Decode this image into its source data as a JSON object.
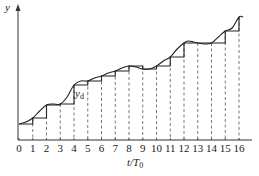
{
  "chart_data": {
    "type": "line",
    "title": "",
    "xlabel": "t/T0",
    "ylabel": "y",
    "annotations": [
      {
        "text": "y_d",
        "near_x": 4.3,
        "description": "label of the sampled/held staircase signal"
      }
    ],
    "grid": false,
    "legend": null,
    "x_ticks": [
      0,
      1,
      2,
      3,
      4,
      5,
      6,
      7,
      8,
      9,
      10,
      11,
      12,
      13,
      14,
      15,
      16
    ],
    "xlim": [
      0,
      16.7
    ],
    "ylim": [
      0,
      13
    ],
    "series": [
      {
        "name": "y (continuous signal)",
        "style": "smooth-curve",
        "x": [
          0,
          0.5,
          1,
          1.5,
          2,
          2.5,
          3,
          3.5,
          4,
          4.5,
          5,
          5.5,
          6,
          6.5,
          7,
          7.5,
          8,
          8.5,
          9,
          9.5,
          10,
          10.5,
          11,
          11.5,
          12,
          12.3,
          12.7,
          13,
          13.5,
          14,
          14.5,
          15,
          15.5,
          16,
          16.3
        ],
        "values": [
          1.6,
          1.8,
          2.2,
          2.9,
          3.5,
          3.6,
          3.6,
          4.3,
          5.5,
          5.9,
          5.9,
          6.2,
          6.4,
          6.7,
          6.9,
          7.2,
          7.4,
          7.3,
          7.1,
          7.1,
          7.4,
          7.9,
          8.3,
          9.1,
          9.7,
          9.9,
          9.8,
          9.7,
          9.6,
          9.7,
          10.3,
          10.9,
          11.2,
          12.3,
          12.3
        ]
      },
      {
        "name": "y_d (zero-order-hold staircase)",
        "style": "step",
        "x": [
          0,
          1,
          2,
          3,
          4,
          5,
          6,
          7,
          8,
          9,
          10,
          11,
          12,
          13,
          14,
          15,
          16
        ],
        "values": [
          1.6,
          2.2,
          3.5,
          3.6,
          5.5,
          5.9,
          6.4,
          6.9,
          7.4,
          7.1,
          7.4,
          8.3,
          9.7,
          9.7,
          9.7,
          10.9,
          12.3
        ]
      }
    ],
    "dashed_verticals_at": [
      1,
      2,
      3,
      4,
      5,
      6,
      7,
      8,
      9,
      10,
      11,
      12,
      13,
      14,
      15,
      16
    ]
  },
  "labels": {
    "y_axis": "y",
    "x_axis_main": "t/T",
    "x_axis_sub": "0",
    "yd_main": "y",
    "yd_sub": "d",
    "ticks": [
      "0",
      "1",
      "2",
      "3",
      "4",
      "5",
      "6",
      "7",
      "8",
      "9",
      "10",
      "11",
      "12",
      "13",
      "14",
      "15",
      "16"
    ]
  }
}
